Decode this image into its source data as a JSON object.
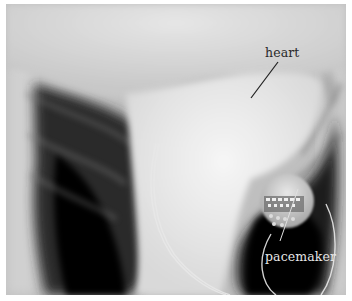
{
  "image": {
    "description": "Inverted chest X-ray showing heart and implanted pacemaker with leads",
    "labels": {
      "heart": "heart",
      "pacemaker": "pacemaker"
    },
    "colors": {
      "border": "#ffffff",
      "label_dark": "#2a2a2a",
      "label_light": "#e6e6e6"
    }
  }
}
